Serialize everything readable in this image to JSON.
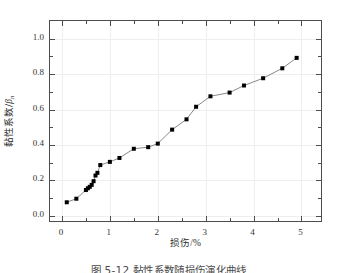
{
  "figure": {
    "caption": "图 5-12  黏性系数随损伤演化曲线",
    "background_color": "#ffffff",
    "frame_color": "#4d4d4d",
    "grid_color": "#eeeef1",
    "marker_color": "#000000",
    "line_color": "#7a7a7a"
  },
  "chart_data": {
    "type": "scatter",
    "title": "",
    "subtitle": "",
    "xlabel": "损伤/%",
    "ylabel": "黏性系数/β",
    "ylabel_text": "黏性系数/",
    "ylabel_symbol": "β",
    "ylabel_subscript": "n",
    "xlabel_text": "损伤",
    "xlabel_unit": "/%",
    "xlim": [
      -0.25,
      5.45
    ],
    "ylim": [
      -0.04,
      1.1
    ],
    "xticks": [
      0,
      1,
      2,
      3,
      4,
      5
    ],
    "xticklabels": [
      "0",
      "1",
      "2",
      "3",
      "4",
      "5"
    ],
    "xminorticks": [
      0.5,
      1.5,
      2.5,
      3.5,
      4.5
    ],
    "yticks": [
      0.0,
      0.2,
      0.4,
      0.6,
      0.8,
      1.0
    ],
    "yticklabels": [
      "0.0",
      "0.2",
      "0.4",
      "0.6",
      "0.8",
      "1.0"
    ],
    "yminorticks": [
      0.1,
      0.3,
      0.5,
      0.7,
      0.9
    ],
    "grid": true,
    "legend": null,
    "marker": "square",
    "marker_size": 4,
    "line_style": "solid",
    "series": [
      {
        "name": "黏性系数",
        "x": [
          0.1,
          0.3,
          0.5,
          0.54,
          0.58,
          0.62,
          0.66,
          0.7,
          0.74,
          0.8,
          1.0,
          1.2,
          1.5,
          1.8,
          2.0,
          2.3,
          2.6,
          2.8,
          3.1,
          3.5,
          3.8,
          4.2,
          4.6,
          4.9
        ],
        "y": [
          0.077,
          0.097,
          0.146,
          0.156,
          0.164,
          0.175,
          0.196,
          0.228,
          0.243,
          0.287,
          0.305,
          0.327,
          0.379,
          0.388,
          0.408,
          0.487,
          0.545,
          0.616,
          0.675,
          0.696,
          0.736,
          0.777,
          0.833,
          0.892
        ]
      }
    ]
  }
}
